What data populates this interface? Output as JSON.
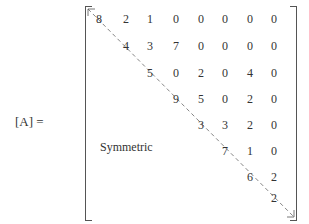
{
  "equation": {
    "lhs": "[A] =",
    "symmetric_label": "Symmetric",
    "matrix_rows": [
      [
        "8",
        "2",
        "1",
        "0",
        "0",
        "0",
        "0",
        "0"
      ],
      [
        "4",
        "3",
        "7",
        "0",
        "0",
        "0",
        "0"
      ],
      [
        "5",
        "0",
        "2",
        "0",
        "4",
        "0"
      ],
      [
        "9",
        "5",
        "0",
        "2",
        "0"
      ],
      [
        "3",
        "3",
        "2",
        "0"
      ],
      [
        "7",
        "1",
        "0"
      ],
      [
        "6",
        "2"
      ],
      [
        "2"
      ]
    ]
  }
}
